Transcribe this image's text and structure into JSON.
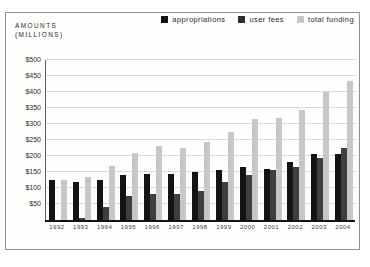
{
  "figure": {
    "amounts_label_line1": "AMOUNTS",
    "amounts_label_line2": "(MILLIONS)",
    "frame_border_color": "#8f8f8f",
    "background_color": "#fefefd"
  },
  "legend": {
    "position": "top-right",
    "items": [
      {
        "label": "appropriations",
        "color": "#131313"
      },
      {
        "label": "user fees",
        "color": "#2e2e2e"
      },
      {
        "label": "total funding",
        "color": "#c7c7c5"
      }
    ]
  },
  "chart_data": {
    "type": "bar",
    "title": "",
    "ylabel": "AMOUNTS (MILLIONS)",
    "xlabel": "",
    "units": "millions of dollars",
    "categories": [
      "1992",
      "1993",
      "1994",
      "1995",
      "1996",
      "1997",
      "1998",
      "1999",
      "2000",
      "2001",
      "2002",
      "2003",
      "2004"
    ],
    "series": [
      {
        "name": "appropriations",
        "color": "#131313",
        "values": [
          125,
          120,
          125,
          140,
          145,
          145,
          150,
          155,
          165,
          160,
          180,
          205,
          205
        ]
      },
      {
        "name": "user fees",
        "color": "#3f3f3f",
        "values": [
          0,
          5,
          40,
          75,
          80,
          80,
          90,
          120,
          140,
          155,
          165,
          195,
          225
        ]
      },
      {
        "name": "total funding",
        "color": "#c7c7c5",
        "values": [
          125,
          135,
          170,
          210,
          230,
          225,
          245,
          275,
          315,
          320,
          345,
          400,
          435
        ]
      }
    ],
    "ylim": [
      0,
      500
    ],
    "ytick_interval": 50,
    "ytick_prefix": "$",
    "ytick_labels": [
      "$50",
      "$100",
      "$150",
      "$200",
      "$250",
      "$300",
      "$350",
      "$400",
      "$450",
      "$500"
    ],
    "grid": true,
    "gridline_color": "#dbdbd8",
    "legend_position": "top-right"
  }
}
